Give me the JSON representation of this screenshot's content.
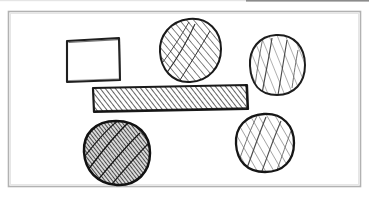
{
  "canvas": {
    "width": 369,
    "height": 198,
    "background_color": "#ffffff",
    "medium": "hand-drawn ink sketch on white paper",
    "title": "Hand-drawn geometric shapes sketch"
  },
  "top_edge_artifact": {
    "name": "scan-edge-line",
    "color": "#6e6e6e",
    "x": 246,
    "y": 0,
    "width": 123,
    "height": 2,
    "description": "faint dark scan edge along the very top right"
  },
  "frame": {
    "name": "page-border-frame",
    "stroke_color": "#b0b0b0",
    "stroke_width": 1.6,
    "x": 8,
    "y": 11,
    "width": 353,
    "height": 176,
    "fill": "#ffffff"
  },
  "ink": {
    "outline_color": "#1a1a1a",
    "hatch_dark_color": "#2a2a2a",
    "hatch_mid_color": "#555555",
    "hatch_light_color": "#777777"
  },
  "shapes": [
    {
      "id": "square",
      "name": "empty-square",
      "label": "Square",
      "type": "rectangle",
      "fill_style": "unfilled",
      "hatch_density": "none",
      "shade": "white",
      "cx": 93,
      "cy": 60,
      "width": 55,
      "height": 44,
      "x": 66,
      "y": 38,
      "stroke_width": 2.0
    },
    {
      "id": "bar",
      "name": "hatched-horizontal-bar",
      "label": "Bar",
      "type": "rectangle",
      "fill_style": "diagonal-hatch",
      "hatch_direction": "forward-slash",
      "hatch_density": "dense",
      "shade": "medium-dark",
      "cx": 170,
      "cy": 98,
      "width": 155,
      "height": 25,
      "x": 93,
      "y": 85,
      "tilt_degrees": -2.5,
      "stroke_width": 2.2
    },
    {
      "id": "circle-top-middle",
      "name": "hatched-circle-top-middle",
      "label": "Circle A",
      "type": "circle",
      "fill_style": "diagonal-hatch",
      "hatch_direction": "forward-slash",
      "hatch_density": "medium",
      "shade": "medium",
      "cx": 190,
      "cy": 50,
      "rx": 31,
      "ry": 32,
      "stroke_width": 2.0
    },
    {
      "id": "circle-top-right",
      "name": "hatched-circle-top-right",
      "label": "Circle B",
      "type": "circle",
      "fill_style": "diagonal-hatch",
      "hatch_direction": "forward-slash",
      "hatch_density": "sparse",
      "shade": "light",
      "cx": 277,
      "cy": 65,
      "rx": 28,
      "ry": 30,
      "stroke_width": 2.0
    },
    {
      "id": "circle-bottom-left",
      "name": "hatched-circle-bottom-left",
      "label": "Circle C",
      "type": "circle",
      "fill_style": "diagonal-hatch",
      "hatch_direction": "forward-slash",
      "hatch_density": "very-dense",
      "shade": "dark",
      "cx": 117,
      "cy": 153,
      "rx": 33,
      "ry": 32,
      "stroke_width": 2.4
    },
    {
      "id": "circle-bottom-right",
      "name": "hatched-circle-bottom-right",
      "label": "Circle D",
      "type": "circle",
      "fill_style": "diagonal-hatch",
      "hatch_direction": "forward-slash",
      "hatch_density": "sparse",
      "shade": "light",
      "cx": 265,
      "cy": 143,
      "rx": 30,
      "ry": 29,
      "stroke_width": 2.2
    }
  ],
  "counts": {
    "total_shapes": 6,
    "circles": 4,
    "rectangles": 2,
    "filled_shapes": 5,
    "unfilled_shapes": 1
  }
}
